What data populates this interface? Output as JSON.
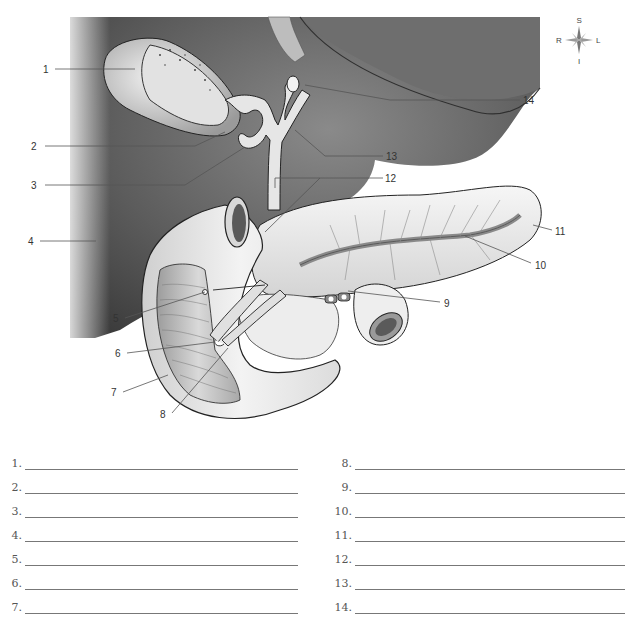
{
  "diagram": {
    "compass": {
      "top": "S",
      "left": "R",
      "right": "L",
      "bottom": "I"
    },
    "callouts": [
      {
        "n": "1",
        "x": 43,
        "y": 70,
        "side": "left"
      },
      {
        "n": "2",
        "x": 31,
        "y": 146,
        "side": "left"
      },
      {
        "n": "3",
        "x": 31,
        "y": 185,
        "side": "left"
      },
      {
        "n": "4",
        "x": 28,
        "y": 242,
        "side": "left"
      },
      {
        "n": "5",
        "x": 113,
        "y": 319,
        "side": "left"
      },
      {
        "n": "6",
        "x": 115,
        "y": 355,
        "side": "left"
      },
      {
        "n": "7",
        "x": 111,
        "y": 394,
        "side": "left"
      },
      {
        "n": "8",
        "x": 160,
        "y": 415,
        "side": "left"
      },
      {
        "n": "9",
        "x": 444,
        "y": 304,
        "side": "right"
      },
      {
        "n": "10",
        "x": 535,
        "y": 266,
        "side": "right"
      },
      {
        "n": "11",
        "x": 555,
        "y": 232,
        "side": "right"
      },
      {
        "n": "12",
        "x": 385,
        "y": 180,
        "side": "right"
      },
      {
        "n": "13",
        "x": 386,
        "y": 158,
        "side": "right"
      },
      {
        "n": "14",
        "x": 523,
        "y": 102,
        "side": "right"
      }
    ]
  },
  "answers": {
    "left": [
      {
        "num": "1."
      },
      {
        "num": "2."
      },
      {
        "num": "3."
      },
      {
        "num": "4."
      },
      {
        "num": "5."
      },
      {
        "num": "6."
      },
      {
        "num": "7."
      }
    ],
    "right": [
      {
        "num": "8."
      },
      {
        "num": "9."
      },
      {
        "num": "10."
      },
      {
        "num": "11."
      },
      {
        "num": "12."
      },
      {
        "num": "13."
      },
      {
        "num": "14."
      }
    ]
  },
  "colors": {
    "background": "#ffffff",
    "organ_dark": "#5a5a5a",
    "organ_light": "#e8e8e8",
    "line": "#777777"
  }
}
